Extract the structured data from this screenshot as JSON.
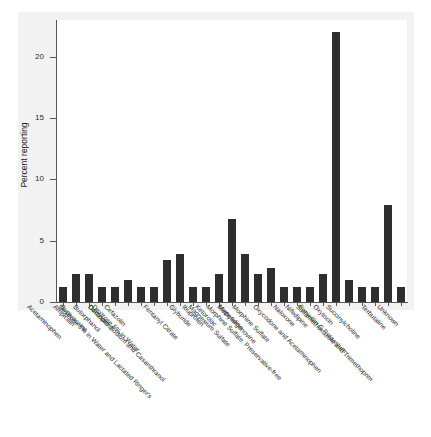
{
  "figure": {
    "background_color": "#ffffff",
    "panel_color": "#f2f2f2",
    "bar_color": "#2e2e2e",
    "axis_color": "#555555"
  },
  "chart_data": {
    "type": "bar",
    "title": "",
    "xlabel": "",
    "ylabel": "Percent reporting",
    "ylim": [
      0,
      23
    ],
    "yticks": [
      0,
      5,
      10,
      15,
      20
    ],
    "ytick_labels": [
      "0",
      "5",
      "10",
      "15",
      "20"
    ],
    "grid": false,
    "legend": null,
    "orientation": "vertical",
    "categories": [
      "Acetaminophen",
      "Ampicillin",
      "Bupivacaine",
      "Butorphanol",
      "Carboprost",
      "Cefazolin",
      "Dextrose 5% in Water",
      "Dextrose 5% in Water and Lactated Ringer's",
      "Docusate Sodium and Casanthranol",
      "Fentanyl Citrate",
      "Glyburide",
      "Ibuprofen",
      "Ketorolac",
      "Magnesium Sulfate",
      "Meperidine",
      "Methylergonovine",
      "Morphine Sulfate",
      "Morphine Sulfate, Preservative-free",
      "Naloxone",
      "Nifedipine",
      "Oxycodone and Acetaminophen",
      "Oxytocin",
      "Penicillin G Potassium",
      "Succinylcholine",
      "Sulfamethoxazole and Trimethoprim",
      "Terbutaline",
      "Unknown"
    ],
    "values": [
      1.2,
      2.3,
      2.3,
      1.2,
      1.2,
      1.8,
      1.2,
      1.2,
      3.4,
      3.9,
      1.2,
      1.2,
      2.3,
      6.8,
      3.9,
      2.3,
      2.8,
      1.2,
      1.2,
      1.2,
      2.3,
      22.0,
      1.8,
      1.2,
      1.2,
      7.9,
      1.2
    ]
  }
}
